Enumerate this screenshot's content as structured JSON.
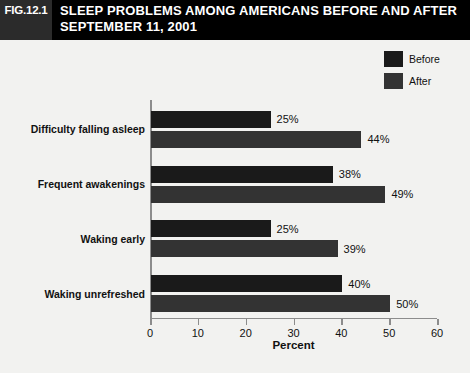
{
  "header": {
    "fig_tag": "FIG.12.1",
    "title_line1": "SLEEP PROBLEMS AMONG AMERICANS BEFORE AND AFTER",
    "title_line2": "SEPTEMBER 11, 2001"
  },
  "colors": {
    "before": "#1a1a1a",
    "after": "#333333",
    "background": "#f2f2f0",
    "header_bar": "#000000",
    "fig_tag_bg": "#2b2b2b",
    "axis": "#8c8c8c",
    "text": "#111111"
  },
  "legend": {
    "position": "top-right",
    "items": [
      {
        "label": "Before",
        "color": "#1a1a1a"
      },
      {
        "label": "After",
        "color": "#333333"
      }
    ]
  },
  "chart_data": {
    "type": "bar",
    "orientation": "horizontal",
    "title": "SLEEP PROBLEMS AMONG AMERICANS BEFORE AND AFTER SEPTEMBER 11, 2001",
    "xlabel": "Percent",
    "ylabel": "",
    "xlim": [
      0,
      60
    ],
    "xticks": [
      0,
      10,
      20,
      30,
      40,
      50,
      60
    ],
    "grid": false,
    "legend_position": "top-right",
    "categories": [
      "Difficulty falling asleep",
      "Frequent awakenings",
      "Waking early",
      "Waking unrefreshed"
    ],
    "series": [
      {
        "name": "Before",
        "values": [
          25,
          38,
          25,
          40
        ],
        "labels": [
          "25%",
          "38%",
          "25%",
          "40%"
        ],
        "color": "#1a1a1a"
      },
      {
        "name": "After",
        "values": [
          44,
          49,
          39,
          50
        ],
        "labels": [
          "44%",
          "49%",
          "39%",
          "50%"
        ],
        "color": "#333333"
      }
    ]
  }
}
